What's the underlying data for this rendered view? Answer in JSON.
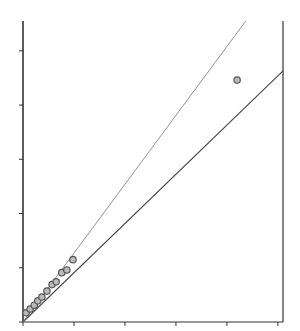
{
  "chart_data": {
    "type": "scatter",
    "title": "",
    "xlabel": "",
    "ylabel": "",
    "xlim": [
      0,
      5.1
    ],
    "ylim": [
      0,
      5.55
    ],
    "x_ticks": [
      0,
      1,
      2,
      3,
      4,
      5
    ],
    "y_ticks": [
      0,
      1,
      2,
      3,
      4,
      5
    ],
    "x_tick_labels": [],
    "y_tick_labels": [],
    "grid": false,
    "legend": null,
    "series": [
      {
        "name": "points",
        "kind": "scatter",
        "marker": "open-circle",
        "x": [
          0.06,
          0.14,
          0.22,
          0.29,
          0.37,
          0.47,
          0.57,
          0.65,
          0.76,
          0.86,
          0.98,
          4.2
        ],
        "y": [
          0.17,
          0.24,
          0.31,
          0.39,
          0.46,
          0.57,
          0.69,
          0.74,
          0.91,
          0.96,
          1.15,
          4.46
        ]
      },
      {
        "name": "solid-line",
        "kind": "line",
        "style": "solid",
        "x": [
          0,
          5.1
        ],
        "y": [
          0,
          4.63
        ]
      },
      {
        "name": "thin-line",
        "kind": "line",
        "style": "thin",
        "x": [
          0,
          4.37
        ],
        "y": [
          0,
          5.55
        ]
      }
    ]
  },
  "style": {
    "axis_color": "#333333",
    "line_color": "#444444",
    "thin_line_color": "#777777",
    "marker_edge": "#555555",
    "marker_fill": "#bbbbbb"
  },
  "plot_box": {
    "left": 23,
    "right": 283,
    "top": 21,
    "bottom": 322
  }
}
